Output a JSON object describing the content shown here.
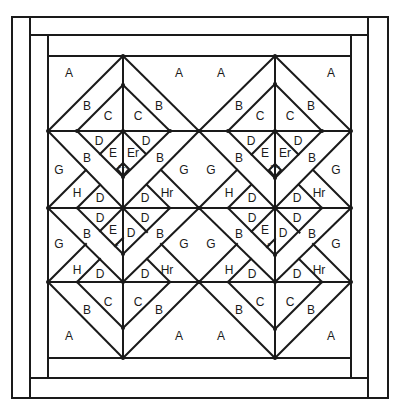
{
  "diagram": {
    "type": "quilt-block-pattern",
    "colors": {
      "line": "#1a1a1a",
      "background": "#ffffff"
    },
    "frame": {
      "outer": [
        12,
        17,
        388,
        398
      ],
      "borders": [
        [
          [
            30,
            17
          ],
          [
            30,
            398
          ]
        ],
        [
          [
            30,
            35
          ],
          [
            368,
            35
          ]
        ],
        [
          [
            368,
            17
          ],
          [
            368,
            398
          ]
        ],
        [
          [
            30,
            378
          ],
          [
            368,
            378
          ]
        ],
        [
          [
            48,
            35
          ],
          [
            48,
            378
          ]
        ],
        [
          [
            48,
            56
          ],
          [
            351,
            56
          ]
        ],
        [
          [
            351,
            35
          ],
          [
            351,
            378
          ]
        ],
        [
          [
            48,
            358
          ],
          [
            351,
            358
          ]
        ]
      ]
    },
    "blocks": [
      {
        "name": "left-tree-block",
        "x0": 48,
        "cx": 123,
        "x1": 199
      },
      {
        "name": "right-tree-block",
        "x0": 199,
        "cx": 275,
        "x1": 351
      }
    ],
    "rows_y": {
      "top": 56,
      "r1": 131,
      "r2": 208,
      "r3": 282,
      "bottom": 358
    },
    "piece_labels": [
      {
        "t": "A",
        "dx": -54,
        "y": 73
      },
      {
        "t": "A",
        "dx": 56,
        "y": 73
      },
      {
        "t": "B",
        "dx": -36,
        "y": 106
      },
      {
        "t": "B",
        "dx": 36,
        "y": 106
      },
      {
        "t": "C",
        "dx": -15,
        "y": 116
      },
      {
        "t": "C",
        "dx": 15,
        "y": 116
      },
      {
        "t": "D",
        "dx": -24,
        "y": 141
      },
      {
        "t": "D",
        "dx": 23,
        "y": 141
      },
      {
        "t": "E",
        "dx": -10,
        "y": 153
      },
      {
        "t": "Er",
        "dx": 10,
        "y": 153
      },
      {
        "t": "F Fr",
        "dx": 0,
        "y": 167,
        "tiny": true
      },
      {
        "t": "B",
        "dx": -36,
        "y": 158
      },
      {
        "t": "B",
        "dx": 37,
        "y": 158
      },
      {
        "t": "G",
        "dx": -64,
        "y": 170
      },
      {
        "t": "G",
        "dx": 61,
        "y": 170
      },
      {
        "t": "H",
        "dx": -46,
        "y": 193
      },
      {
        "t": "D",
        "dx": -23,
        "y": 198
      },
      {
        "t": "D",
        "dx": 22,
        "y": 198
      },
      {
        "t": "Hr",
        "dx": 44,
        "y": 193
      },
      {
        "t": "D",
        "dx": -23,
        "y": 218
      },
      {
        "t": "D",
        "dx": 22,
        "y": 218
      },
      {
        "t": "E",
        "dx": -10,
        "y": 230
      },
      {
        "t": "F",
        "dx": -6,
        "y": 245,
        "tiny": true
      },
      {
        "t": "D",
        "dx": 8,
        "y": 233
      },
      {
        "t": "B",
        "dx": -36,
        "y": 234
      },
      {
        "t": "B",
        "dx": 37,
        "y": 234
      },
      {
        "t": "G",
        "dx": -64,
        "y": 244
      },
      {
        "t": "G",
        "dx": 61,
        "y": 244
      },
      {
        "t": "H",
        "dx": -46,
        "y": 270
      },
      {
        "t": "D",
        "dx": -23,
        "y": 274
      },
      {
        "t": "D",
        "dx": 22,
        "y": 274
      },
      {
        "t": "Hr",
        "dx": 44,
        "y": 270
      },
      {
        "t": "C",
        "dx": -15,
        "y": 302
      },
      {
        "t": "C",
        "dx": 15,
        "y": 302
      },
      {
        "t": "B",
        "dx": -36,
        "y": 310
      },
      {
        "t": "B",
        "dx": 36,
        "y": 310
      },
      {
        "t": "A",
        "dx": -54,
        "y": 336
      },
      {
        "t": "A",
        "dx": 56,
        "y": 336
      }
    ]
  }
}
